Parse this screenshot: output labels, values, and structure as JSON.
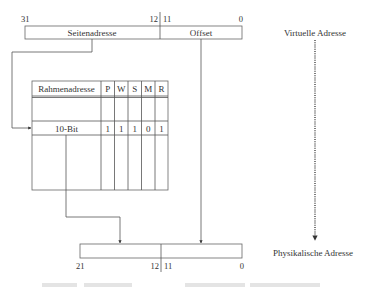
{
  "virtual_address": {
    "label": "Virtuelle Adresse",
    "fields": [
      {
        "name": "Seitenadresse",
        "high_bit": "31",
        "low_bit": "12"
      },
      {
        "name": "Offset",
        "high_bit": "11",
        "low_bit": "0"
      }
    ]
  },
  "page_table": {
    "headers": [
      "Rahmenadresse",
      "P",
      "W",
      "S",
      "M",
      "R"
    ],
    "entry": [
      "10-Bit",
      "1",
      "1",
      "1",
      "0",
      "1"
    ]
  },
  "physical_address": {
    "label": "Physikalische Adresse",
    "fields": [
      {
        "name": "",
        "high_bit": "21",
        "low_bit": "12"
      },
      {
        "name": "",
        "high_bit": "11",
        "low_bit": "0"
      }
    ]
  }
}
